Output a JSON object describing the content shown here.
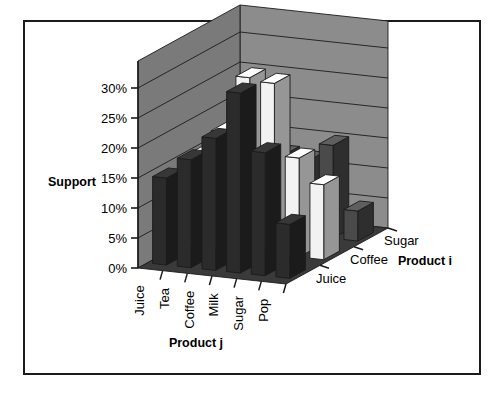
{
  "chart_data": {
    "type": "bar",
    "render": "3d-column",
    "title": "",
    "xlabel": "Product j",
    "ylabel": "Support",
    "zlabel": "Product i",
    "categories": [
      "Juice",
      "Tea",
      "Coffee",
      "Milk",
      "Sugar",
      "Pop"
    ],
    "series_axis_labels": [
      "Juice",
      "Coffee",
      "Sugar"
    ],
    "ylim": [
      0,
      30
    ],
    "ytick_labels": [
      "0%",
      "5%",
      "10%",
      "15%",
      "20%",
      "25%",
      "30%"
    ],
    "ytick_values": [
      0,
      5,
      10,
      15,
      20,
      25,
      30
    ],
    "grid": true,
    "legend": "none",
    "series": [
      {
        "name": "Sugar",
        "fill": "#2b2b2b",
        "values": [
          14.5,
          18.0,
          22.0,
          30.0,
          20.5,
          9.0
        ]
      },
      {
        "name": "Coffee",
        "fill": "#f2f2f2",
        "values": [
          15.0,
          19.5,
          29.0,
          28.5,
          16.5,
          12.5
        ]
      },
      {
        "name": "Juice",
        "fill": "#4a4a4a",
        "values": [
          9.5,
          6.0,
          13.0,
          12.5,
          15.5,
          5.0
        ]
      }
    ],
    "colors": {
      "back_wall": "#8c8c8c",
      "side_wall": "#7a7a7a",
      "floor": "#3a3a3a",
      "grid_line": "#1b1b1b",
      "frame": "#1b1b1b",
      "background": "#ffffff"
    }
  }
}
